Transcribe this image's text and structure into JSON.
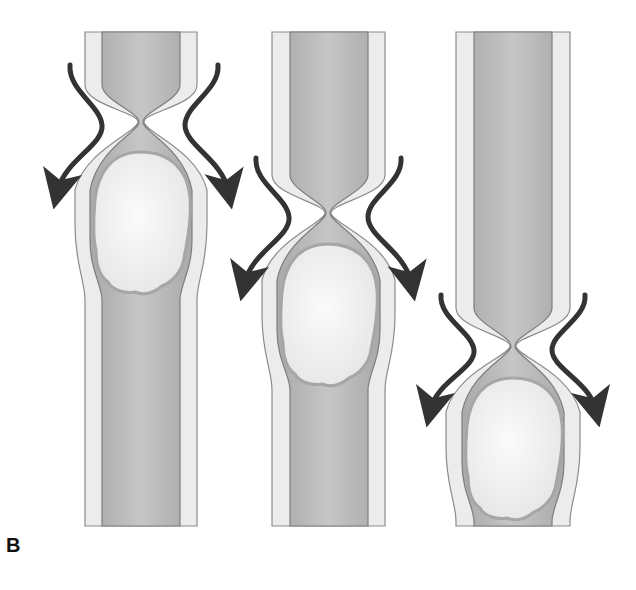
{
  "figure": {
    "panel_label": "B",
    "colors": {
      "outer_wall_fill": "#ececec",
      "wall_line": "#8c8c8c",
      "lumen_fill": "#bdbdbd",
      "lumen_shade": "#aaaaaa",
      "bolus_fill": "#f4f4f4",
      "bolus_rim": "#a6a6a6",
      "arrow": "#333333",
      "background": "#ffffff"
    },
    "stages": [
      {
        "name": "stage-1",
        "constriction_y": 120,
        "bolus_top": 150,
        "bolus_bottom": 295,
        "arrow_start_y": 65,
        "arrow_end_y": 200
      },
      {
        "name": "stage-2",
        "constriction_y": 212,
        "bolus_top": 243,
        "bolus_bottom": 385,
        "arrow_start_y": 158,
        "arrow_end_y": 300
      },
      {
        "name": "stage-3",
        "constriction_y": 345,
        "bolus_top": 377,
        "bolus_bottom": 520,
        "arrow_start_y": 295,
        "arrow_end_y": 410
      }
    ]
  }
}
